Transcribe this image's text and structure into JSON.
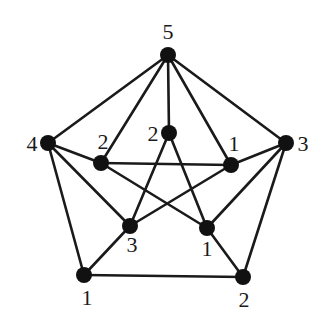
{
  "diagram": {
    "type": "graph",
    "node_radius": 8,
    "colors": {
      "edge": "#1a1a1a",
      "node": "#111111",
      "label": "#1a1a1a",
      "background": "#ffffff"
    },
    "nodes": [
      {
        "id": "top",
        "label": "5",
        "x": 168,
        "y": 55,
        "lx": 168,
        "ly": 39,
        "anchor": "middle"
      },
      {
        "id": "outer-left",
        "label": "4",
        "x": 48,
        "y": 143,
        "lx": 32,
        "ly": 151,
        "anchor": "middle"
      },
      {
        "id": "outer-right",
        "label": "3",
        "x": 286,
        "y": 143,
        "lx": 303,
        "ly": 151,
        "anchor": "middle"
      },
      {
        "id": "outer-bottom-left",
        "label": "1",
        "x": 84,
        "y": 275,
        "lx": 87,
        "ly": 305,
        "anchor": "middle"
      },
      {
        "id": "outer-bottom-right",
        "label": "2",
        "x": 243,
        "y": 277,
        "lx": 244,
        "ly": 307,
        "anchor": "middle"
      },
      {
        "id": "inner-top",
        "label": "2",
        "x": 169,
        "y": 133,
        "lx": 153,
        "ly": 141,
        "anchor": "middle"
      },
      {
        "id": "inner-left",
        "label": "2",
        "x": 101,
        "y": 163,
        "lx": 103,
        "ly": 149,
        "anchor": "middle"
      },
      {
        "id": "inner-right",
        "label": "1",
        "x": 231,
        "y": 165,
        "lx": 234,
        "ly": 151,
        "anchor": "middle"
      },
      {
        "id": "inner-bottom-left",
        "label": "3",
        "x": 130,
        "y": 226,
        "lx": 132,
        "ly": 252,
        "anchor": "middle"
      },
      {
        "id": "inner-bottom-right",
        "label": "1",
        "x": 207,
        "y": 228,
        "lx": 207,
        "ly": 256,
        "anchor": "middle"
      }
    ],
    "edges": [
      [
        "top",
        "outer-left"
      ],
      [
        "top",
        "outer-right"
      ],
      [
        "top",
        "inner-left"
      ],
      [
        "top",
        "inner-top"
      ],
      [
        "top",
        "inner-right"
      ],
      [
        "outer-left",
        "inner-left"
      ],
      [
        "outer-left",
        "inner-bottom-left"
      ],
      [
        "outer-left",
        "outer-bottom-left"
      ],
      [
        "outer-right",
        "inner-right"
      ],
      [
        "outer-right",
        "inner-bottom-right"
      ],
      [
        "outer-right",
        "outer-bottom-right"
      ],
      [
        "inner-left",
        "inner-right"
      ],
      [
        "inner-left",
        "inner-bottom-right"
      ],
      [
        "inner-top",
        "inner-bottom-left"
      ],
      [
        "inner-top",
        "inner-bottom-right"
      ],
      [
        "inner-right",
        "inner-bottom-left"
      ],
      [
        "inner-bottom-left",
        "outer-bottom-left"
      ],
      [
        "inner-bottom-right",
        "outer-bottom-right"
      ],
      [
        "outer-bottom-left",
        "outer-bottom-right"
      ]
    ]
  }
}
